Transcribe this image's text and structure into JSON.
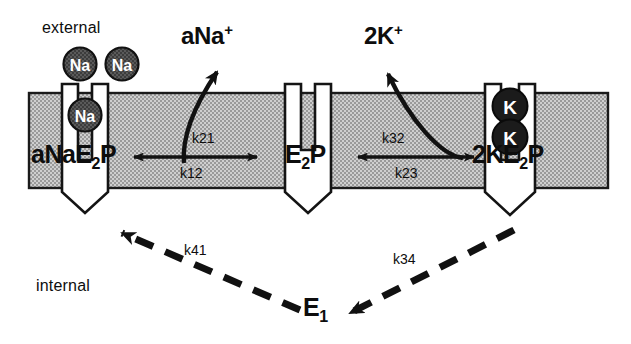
{
  "figure": {
    "type": "diagram",
    "background_color": "#ffffff",
    "membrane_fill_color": "#b8b8b8",
    "membrane_outline_color": "#1a1a1a",
    "pump_fill_color": "#ffffff",
    "ion_na_fill_color": "#4f4f4f",
    "ion_k_fill_color": "#1a1a1a",
    "text_color": "#0d0d0d"
  },
  "compartments": {
    "external_label": "external",
    "internal_label": "internal"
  },
  "ions": {
    "na_label": "Na",
    "k_label": "K",
    "external_na_count": 2,
    "channel_na_count": 1,
    "channel_k_count": 2
  },
  "released_species": {
    "sodium": {
      "text": "aNa",
      "charge": "+"
    },
    "potassium": {
      "text": "2K",
      "charge": "+"
    }
  },
  "states": [
    {
      "id": "state1",
      "main": "aNa",
      "enzyme": "E",
      "sub": "2",
      "tail": "P"
    },
    {
      "id": "state2",
      "main": "",
      "enzyme": "E",
      "sub": "2",
      "tail": "P"
    },
    {
      "id": "state3",
      "main": "2K",
      "enzyme": "E",
      "sub": "2",
      "tail": "P"
    },
    {
      "id": "state4",
      "main": "",
      "enzyme": "E",
      "sub": "1",
      "tail": ""
    }
  ],
  "rate_constants": {
    "k21": "k21",
    "k12": "k12",
    "k32": "k32",
    "k23": "k23",
    "k41": "k41",
    "k34": "k34"
  }
}
